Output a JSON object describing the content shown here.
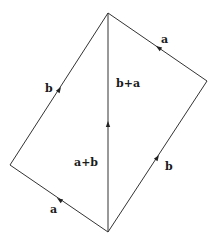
{
  "diagram": {
    "vertices": {
      "top": [
        108,
        13
      ],
      "right": [
        207,
        81
      ],
      "left": [
        10,
        165
      ],
      "bottom": [
        108,
        232
      ]
    },
    "edges": [
      {
        "id": "left-upper",
        "from": "left",
        "to": "top",
        "label": "b"
      },
      {
        "id": "right-upper",
        "from": "right",
        "to": "top",
        "label": "a"
      },
      {
        "id": "diagonal",
        "from": "bottom",
        "to": "top",
        "label_upper": "b+a",
        "label_lower": "a+b"
      },
      {
        "id": "right-lower",
        "from": "bottom",
        "to": "right",
        "label": "b"
      },
      {
        "id": "left-lower",
        "from": "bottom",
        "to": "left",
        "label": "a"
      }
    ],
    "labels": {
      "b_left": "b",
      "a_top": "a",
      "b_plus_a": "b+a",
      "a_plus_b": "a+b",
      "b_right": "b",
      "a_bottom": "a"
    },
    "colors": {
      "line": "#333333",
      "text": "#1a1a1a",
      "background": "#ffffff"
    }
  }
}
